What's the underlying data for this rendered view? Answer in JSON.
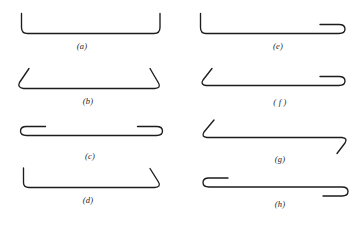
{
  "figure": {
    "background_color": "#ffffff",
    "stroke_color": "#1c1c1c",
    "width": 364,
    "height": 225,
    "columns": 2,
    "rows": 4,
    "panels": [
      {
        "key": "a",
        "label": "(a)",
        "column": "left",
        "row": 1,
        "description": "wide open bracket with vertical arms rising at both ends",
        "left_terminal": "vertical-arm-up",
        "right_terminal": "vertical-arm-up",
        "label_x": 82,
        "label_y": 42,
        "path": "M 21.5 13.5 L 21.5 27.5 Q 21.5 33.5 27.5 33.5 L 154 33.5 Q 160 33.5 160 27.5 L 160 13.5"
      },
      {
        "key": "b",
        "label": "(b)",
        "column": "left",
        "row": 2,
        "description": "wide open bracket with diagonal arms splaying outward at both ends",
        "left_terminal": "diagonal-arm-up-left",
        "right_terminal": "diagonal-arm-up-right",
        "label_x": 88,
        "label_y": 97,
        "path": "M 29 68.5 L 19.5 82.5 Q 17 87.5 23.5 88.5 L 154.5 88.5 Q 161.5 88 158.5 83 L 150 68.5"
      },
      {
        "key": "c",
        "label": "(c)",
        "column": "left",
        "row": 3,
        "description": "flat elongated loop with hairpin folds returning inward at both ends",
        "left_terminal": "hairpin-loop-opening-right",
        "right_terminal": "hairpin-loop-opening-left",
        "label_x": 90,
        "label_y": 152,
        "path": "M 45.5 126.5 L 26.5 126.5 Q 20.5 126.5 20.5 131 Q 20.5 135.5 26.5 135.5 L 156.5 135.5 Q 162.5 135.5 162.5 131 Q 162.5 126.5 156.5 126.5 L 137.5 126.5"
      },
      {
        "key": "d",
        "label": "(d)",
        "column": "left",
        "row": 4,
        "description": "bracket with a vertical arm on the left and a diagonal arm on the right",
        "left_terminal": "vertical-arm-up",
        "right_terminal": "diagonal-arm-up-right",
        "label_x": 88,
        "label_y": 196,
        "path": "M 23.5 168 L 23.5 182.5 Q 23.5 187.5 29 187.5 L 154.5 187.5 Q 161.5 187 158.5 182 L 150 168.5"
      },
      {
        "key": "e",
        "label": "(e)",
        "column": "right",
        "row": 1,
        "description": "bracket with a vertical arm on the left and a hairpin loop on the right",
        "left_terminal": "vertical-arm-up",
        "right_terminal": "hairpin-loop-opening-left",
        "label_x": 278,
        "label_y": 42,
        "path": "M 200.5 13.5 L 200.5 27.5 Q 200.5 33.5 206 33.5 L 339 33.5 Q 345 33.5 345 29 Q 345 24.5 339 24.5 L 320 24.5"
      },
      {
        "key": "f",
        "label": "( f )",
        "column": "right",
        "row": 2,
        "description": "bracket with a diagonal arm on the left and a hairpin loop on the right",
        "left_terminal": "diagonal-arm-up-left",
        "right_terminal": "hairpin-loop-opening-left",
        "label_x": 280,
        "label_y": 98,
        "path": "M 212 68.5 L 203 80 Q 200 84.5 206 85.5 L 339 85.5 Q 345 85.5 345 81 Q 345 76.5 339 76.5 L 320 76.5"
      },
      {
        "key": "g",
        "label": "(g)",
        "column": "right",
        "row": 3,
        "description": "bracket with a diagonal arm up-left on the left and a diagonal arm down-right on the right",
        "left_terminal": "diagonal-arm-up-left",
        "right_terminal": "diagonal-arm-down-right",
        "label_x": 280,
        "label_y": 155,
        "path": "M 214 120 L 204 132 Q 201 137 207 137.5 L 342 137.5 Q 348 138 345 143 L 337 153.5"
      },
      {
        "key": "h",
        "label": "(h)",
        "column": "right",
        "row": 4,
        "description": "flat elongated loop with a hairpin fold above the line at the left and below the line at the right",
        "left_terminal": "hairpin-loop-opening-right-above",
        "right_terminal": "hairpin-loop-opening-left-below",
        "label_x": 280,
        "label_y": 200,
        "path": "M 228 178 L 209 178 Q 203 178 203 182.5 Q 203 187 209 187 L 342 187 Q 348 187 348 191.5 Q 348 196 342 196 L 323 196"
      }
    ]
  }
}
